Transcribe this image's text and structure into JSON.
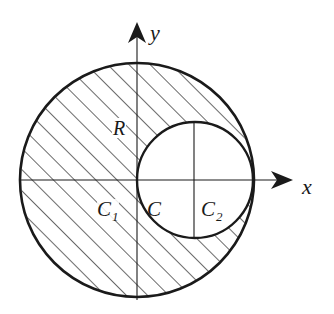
{
  "figure": {
    "type": "hollowed-disk-coordinate-diagram",
    "colors": {
      "stroke": "#1a1a1a",
      "hatch": "#1a1a1a",
      "background": "#ffffff"
    },
    "geometry": {
      "origin_px": [
        137,
        180
      ],
      "large_circle": {
        "cx": 137,
        "cy": 180,
        "r": 117
      },
      "small_circle": {
        "cx": 195,
        "cy": 180,
        "r": 58
      },
      "hatch_spacing_px": 15,
      "hatch_direction": "lower-left to upper-right (45°)"
    },
    "axes": {
      "x": {
        "label": "x"
      },
      "y": {
        "label": "y"
      }
    },
    "labels": {
      "radius": "R",
      "c1_main": "C",
      "c1_sub": "1",
      "c": "C",
      "c2_main": "C",
      "c2_sub": "2"
    }
  }
}
